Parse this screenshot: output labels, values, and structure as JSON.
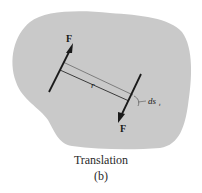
{
  "figure": {
    "caption_title": "Translation",
    "caption_label": "(b)",
    "labels": {
      "force_top": "F",
      "force_bottom": "F",
      "distance": "r",
      "displacement": "ds",
      "displacement_subscript": "t"
    },
    "colors": {
      "body_fill": "#c9c9c9",
      "line": "#1a1a1a",
      "thin_line": "#555555",
      "background": "#ffffff"
    }
  }
}
